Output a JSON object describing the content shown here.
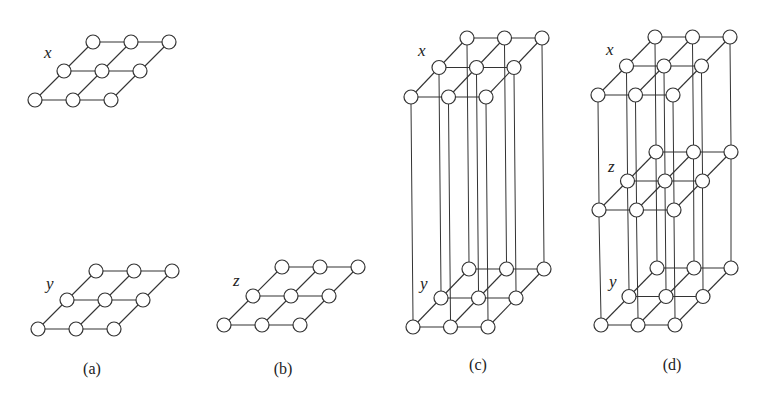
{
  "figure": {
    "node_radius": 7,
    "colors": {
      "stroke": "#333333",
      "node_fill": "#ffffff",
      "background": "#ffffff"
    },
    "panels": [
      {
        "id": "a",
        "caption": "(a)",
        "caption_pos": [
          92,
          374
        ],
        "grids": [
          {
            "label": "x",
            "label_pos": [
              44,
              58
            ],
            "origin": [
              35,
              100
            ],
            "dx": 38,
            "skew": [
              29,
              -29
            ]
          },
          {
            "label": "y",
            "label_pos": [
              46,
              289
            ],
            "origin": [
              38,
              329
            ],
            "dx": 38,
            "skew": [
              29,
              -29
            ]
          }
        ],
        "verticals": []
      },
      {
        "id": "b",
        "caption": "(b)",
        "caption_pos": [
          283,
          374
        ],
        "grids": [
          {
            "label": "z",
            "label_pos": [
              233,
              286
            ],
            "origin": [
              224,
              325
            ],
            "dx": 38,
            "skew": [
              29,
              -29
            ]
          }
        ],
        "verticals": []
      },
      {
        "id": "c",
        "caption": "(c)",
        "caption_pos": [
          478,
          370
        ],
        "grids": [
          {
            "label": "x",
            "label_pos": [
              418,
              56
            ],
            "origin": [
              411,
              97
            ],
            "dx": 37.5,
            "skew": [
              28,
              -29.5
            ]
          },
          {
            "label": "y",
            "label_pos": [
              420,
              289
            ],
            "origin": [
              413,
              327
            ],
            "dx": 37.5,
            "skew": [
              28,
              -29
            ]
          }
        ],
        "verticals": [
          [
            0,
            1
          ]
        ]
      },
      {
        "id": "d",
        "caption": "(d)",
        "caption_pos": [
          672,
          370
        ],
        "grids": [
          {
            "label": "x",
            "label_pos": [
              606,
              55
            ],
            "origin": [
              598,
              95
            ],
            "dx": 37.5,
            "skew": [
              28.5,
              -29
            ]
          },
          {
            "label": "z",
            "label_pos": [
              608,
              172
            ],
            "origin": [
              599,
              210
            ],
            "dx": 37.5,
            "skew": [
              28.5,
              -29
            ]
          },
          {
            "label": "y",
            "label_pos": [
              609,
              287
            ],
            "origin": [
              601,
              325
            ],
            "dx": 37,
            "skew": [
              28,
              -28.5
            ]
          }
        ],
        "verticals": [
          [
            0,
            1
          ],
          [
            1,
            2
          ]
        ]
      }
    ]
  }
}
